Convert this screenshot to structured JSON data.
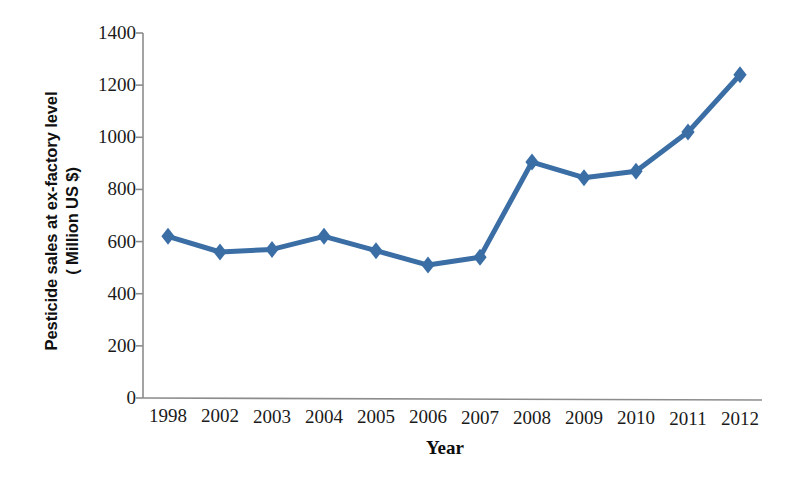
{
  "chart_data": {
    "type": "line",
    "title": "",
    "subtitle": "",
    "xlabel": "Year",
    "ylabel": "Pesticide sales at ex-factory level ( Million US $)",
    "ylabel_lines": [
      "Pesticide sales at ex-factory level",
      "( Million US $)"
    ],
    "categories": [
      "1998",
      "2002",
      "2003",
      "2004",
      "2005",
      "2006",
      "2007",
      "2008",
      "2009",
      "2010",
      "2011",
      "2012"
    ],
    "values": [
      620,
      560,
      570,
      620,
      565,
      510,
      540,
      905,
      845,
      870,
      1020,
      1240
    ],
    "series": [
      {
        "name": "Pesticide sales at ex-factory level",
        "values": [
          620,
          560,
          570,
          620,
          565,
          510,
          540,
          905,
          845,
          870,
          1020,
          1240
        ],
        "color": "#3A6EA5",
        "marker": "diamond",
        "line_width": 5
      }
    ],
    "ylim": [
      0,
      1400
    ],
    "yticks": [
      0,
      200,
      400,
      600,
      800,
      1000,
      1200,
      1400
    ],
    "ytick_labels": [
      "0",
      "200",
      "400",
      "600",
      "800",
      "1000",
      "1200",
      "1400"
    ],
    "grid": false,
    "legend": false,
    "legend_position": "none",
    "axis_color": "#8c8c8c",
    "text_color": "#1a1a1a"
  },
  "axes": {
    "y_title_line1": "Pesticide sales at ex-factory level",
    "y_title_line2": "( Million US $)",
    "x_title": "Year"
  }
}
